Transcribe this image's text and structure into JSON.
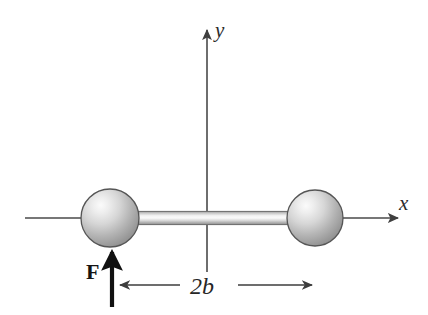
{
  "figure": {
    "background_color": "#ffffff",
    "axes": {
      "y_label": "y",
      "x_label": "x",
      "axis_color": "#4a4a4a",
      "x_axis": {
        "start_x": 25,
        "end_x": 400,
        "y": 218,
        "has_arrow_head": true,
        "arrow_direction": "right"
      },
      "y_axis": {
        "x": 207,
        "start_y": 272,
        "end_y": 28,
        "has_arrow_head": true,
        "arrow_direction": "up"
      },
      "origin": {
        "x": 207,
        "y": 218
      }
    },
    "bodies": {
      "rod": {
        "name": "connecting-rod",
        "left_x": 128,
        "right_x": 296,
        "center_y": 218,
        "thickness": 14,
        "fill_light": "#f2f2f2",
        "fill_dark": "#8d8d8d"
      },
      "spheres": [
        {
          "name": "left-sphere",
          "cx": 110,
          "cy": 218,
          "r": 29,
          "highlight_color": "#f5f5f5",
          "shade_color": "#9a9a9a",
          "outline_color": "#555555"
        },
        {
          "name": "right-sphere",
          "cx": 315,
          "cy": 218,
          "r": 28,
          "highlight_color": "#f5f5f5",
          "shade_color": "#9a9a9a",
          "outline_color": "#555555"
        }
      ]
    },
    "force": {
      "label": "F",
      "label_x": 88,
      "label_y": 278,
      "arrow_x": 112,
      "tail_y": 307,
      "tip_y": 247,
      "direction": "up",
      "color": "#111111"
    },
    "dimension": {
      "label": "2b",
      "label_x": 192,
      "label_y": 294,
      "line_y": 285,
      "left_x": 116,
      "right_x": 316,
      "left_arrow": true,
      "right_arrow": true,
      "color": "#3d3d3d"
    }
  }
}
